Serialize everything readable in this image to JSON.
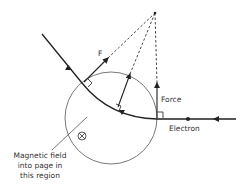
{
  "diagram": {
    "labels": {
      "force": "Force",
      "force_short": "F",
      "electron": "Electron",
      "field_line1": "Magnetic field",
      "field_line2": "into page in",
      "field_line3": "this region"
    },
    "symbols": {
      "field_direction": "into-page-cross",
      "center_of_curvature": "dot"
    },
    "colors": {
      "stroke": "#222222",
      "circle": "#555555",
      "text": "#333333",
      "background": "#ffffff"
    }
  }
}
